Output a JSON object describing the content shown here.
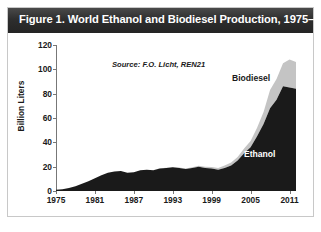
{
  "figure": {
    "title": "Figure 1. World Ethanol and Biodiesel Production, 1975–2012",
    "source_note": "Source: F.O. Licht, REN21"
  },
  "chart_data": {
    "type": "area",
    "stacked": true,
    "title": "Figure 1. World Ethanol and Biodiesel Production, 1975–2012",
    "xlabel": "",
    "ylabel": "Billion Liters",
    "xlim": [
      1975,
      2012
    ],
    "ylim": [
      0,
      120
    ],
    "grid": false,
    "legend": "inline-annotations",
    "source": "Source: F.O. Licht, REN21",
    "yticks": [
      0,
      20,
      40,
      60,
      80,
      100,
      120
    ],
    "xticks": [
      1975,
      1981,
      1987,
      1993,
      1999,
      2005,
      2011
    ],
    "x": [
      1975,
      1976,
      1977,
      1978,
      1979,
      1980,
      1981,
      1982,
      1983,
      1984,
      1985,
      1986,
      1987,
      1988,
      1989,
      1990,
      1991,
      1992,
      1993,
      1994,
      1995,
      1996,
      1997,
      1998,
      1999,
      2000,
      2001,
      2002,
      2003,
      2004,
      2005,
      2006,
      2007,
      2008,
      2009,
      2010,
      2011,
      2012
    ],
    "series": [
      {
        "name": "Ethanol",
        "color": "#1a1a1a",
        "values": [
          1,
          1.5,
          2.5,
          4,
          6,
          8,
          10.5,
          13,
          15,
          16,
          16.5,
          15,
          15.5,
          17,
          17.5,
          17,
          18.5,
          19,
          19.5,
          19,
          18,
          19,
          20,
          19,
          18.5,
          17.5,
          19,
          21,
          25,
          31,
          36,
          45,
          55,
          68,
          75,
          86,
          85,
          84
        ]
      },
      {
        "name": "Biodiesel",
        "color": "#c4c4c4",
        "values": [
          0,
          0,
          0,
          0,
          0,
          0,
          0,
          0,
          0,
          0,
          0,
          0,
          0,
          0,
          0,
          0,
          0.1,
          0.2,
          0.3,
          0.4,
          0.5,
          0.6,
          0.8,
          1,
          1.2,
          1.5,
          2,
          2.5,
          3,
          4,
          5,
          7,
          10,
          15,
          17,
          19,
          23,
          22
        ]
      }
    ]
  },
  "y_ticks": [
    {
      "label": "120",
      "value": 120
    },
    {
      "label": "100",
      "value": 100
    },
    {
      "label": "80",
      "value": 80
    },
    {
      "label": "60",
      "value": 60
    },
    {
      "label": "40",
      "value": 40
    },
    {
      "label": "20",
      "value": 20
    },
    {
      "label": "0",
      "value": 0
    }
  ],
  "x_ticks": [
    {
      "label": "1975",
      "value": 1975
    },
    {
      "label": "1981",
      "value": 1981
    },
    {
      "label": "1987",
      "value": 1987
    },
    {
      "label": "1993",
      "value": 1993
    },
    {
      "label": "1999",
      "value": 1999
    },
    {
      "label": "2005",
      "value": 2005
    },
    {
      "label": "2011",
      "value": 2011
    }
  ],
  "annotations": {
    "biodiesel_label": "Biodiesel",
    "ethanol_label": "Ethanol"
  }
}
